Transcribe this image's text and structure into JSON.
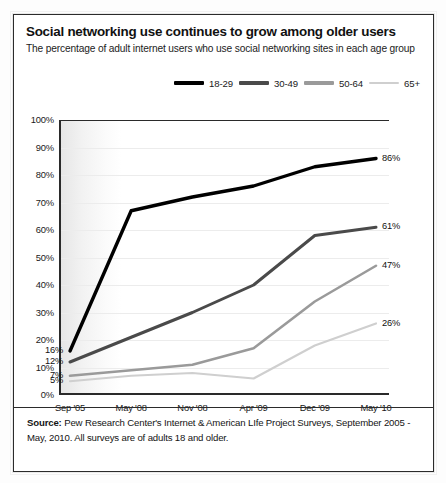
{
  "title": "Social networking use continues to grow among older users",
  "subtitle": "The percentage of adult internet users who use social networking sites in each age group",
  "source": {
    "label": "Source:",
    "text": "Pew Research Center's Internet & American LIfe Project Surveys, September 2005 - May, 2010. All surveys are of adults 18 and older."
  },
  "chart_data": {
    "type": "line",
    "title": "Social networking use continues to grow among older users",
    "subtitle": "The percentage of adult internet users who use social networking sites in each age group",
    "xlabel": "",
    "ylabel": "",
    "ylim": [
      0,
      100
    ],
    "yticks": [
      "0%",
      "10%",
      "20%",
      "30%",
      "40%",
      "50%",
      "60%",
      "70%",
      "80%",
      "90%",
      "100%"
    ],
    "ytick_values": [
      0,
      10,
      20,
      30,
      40,
      50,
      60,
      70,
      80,
      90,
      100
    ],
    "grid": true,
    "legend_position": "top-right",
    "categories": [
      "Sep '05",
      "May '08",
      "Nov '08",
      "Apr '09",
      "Dec '09",
      "May '10"
    ],
    "series": [
      {
        "name": "18-29",
        "color": "#000000",
        "values": [
          16,
          67,
          72,
          76,
          83,
          86
        ],
        "start_label": "16%",
        "end_label": "86%"
      },
      {
        "name": "30-49",
        "color": "#4a4a4a",
        "values": [
          12,
          21,
          30,
          40,
          58,
          61
        ],
        "start_label": "12%",
        "end_label": "61%"
      },
      {
        "name": "50-64",
        "color": "#9a9a9a",
        "values": [
          7,
          9,
          11,
          17,
          34,
          47
        ],
        "start_label": "7%",
        "end_label": "47%"
      },
      {
        "name": "65+",
        "color": "#cfcfcf",
        "values": [
          5,
          7,
          8,
          6,
          18,
          26
        ],
        "start_label": "5%",
        "end_label": "26%"
      }
    ]
  }
}
